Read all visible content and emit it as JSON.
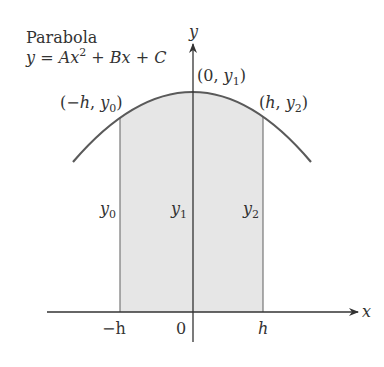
{
  "title": "Parabola",
  "equation": {
    "lhs": "y",
    "eq": " = ",
    "A": "A",
    "x1": "x",
    "exp": "2",
    "plusB": " + ",
    "B": "B",
    "x2": "x",
    "plusC": " + ",
    "C": "C"
  },
  "axes": {
    "x_label": "x",
    "y_label": "y",
    "ticks": {
      "neg_h": "−h",
      "zero": "0",
      "h": "h"
    }
  },
  "points": {
    "left": {
      "open": "(−",
      "var": "h",
      "sep": ", ",
      "y": "y",
      "sub": "0",
      "close": ")"
    },
    "top": {
      "open": "(0, ",
      "y": "y",
      "sub": "1",
      "close": ")"
    },
    "right": {
      "open": "(",
      "var": "h",
      "sep": ", ",
      "y": "y",
      "sub": "2",
      "close": ")"
    }
  },
  "ordinates": {
    "y0": {
      "y": "y",
      "sub": "0"
    },
    "y1": {
      "y": "y",
      "sub": "1"
    },
    "y2": {
      "y": "y",
      "sub": "2"
    }
  },
  "colors": {
    "curve": "#5a5a5a",
    "shade": "#e6e6e6",
    "axis": "#333333"
  }
}
